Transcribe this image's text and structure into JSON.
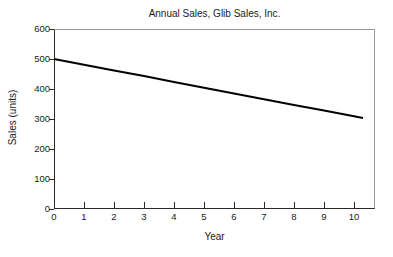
{
  "chart_data": {
    "type": "line",
    "title": "Annual Sales, Glib Sales, Inc.",
    "xlabel": "Year",
    "ylabel": "Sales (units)",
    "xlim": [
      0,
      10.7
    ],
    "ylim": [
      0,
      600
    ],
    "grid": false,
    "legend": null,
    "xticks": [
      0,
      1,
      2,
      3,
      4,
      5,
      6,
      7,
      8,
      9,
      10
    ],
    "xtick_labels": [
      "0",
      "1",
      "2",
      "3",
      "4",
      "5",
      "6",
      "7",
      "8",
      "9",
      "10"
    ],
    "yticks": [
      0,
      100,
      200,
      300,
      400,
      500,
      600
    ],
    "ytick_labels": [
      "0",
      "100",
      "200",
      "300",
      "400",
      "500",
      "600"
    ],
    "series": [
      {
        "name": "Annual Sales",
        "color": "#000000",
        "line_width": 2,
        "x": [
          0,
          10.3
        ],
        "values": [
          500,
          303
        ],
        "points": [
          {
            "x": 0,
            "y": 500
          },
          {
            "x": 1,
            "y": 481
          },
          {
            "x": 2,
            "y": 462
          },
          {
            "x": 3,
            "y": 443
          },
          {
            "x": 4,
            "y": 423
          },
          {
            "x": 5,
            "y": 404
          },
          {
            "x": 6,
            "y": 385
          },
          {
            "x": 7,
            "y": 366
          },
          {
            "x": 8,
            "y": 347
          },
          {
            "x": 9,
            "y": 328
          },
          {
            "x": 10,
            "y": 309
          },
          {
            "x": 10.3,
            "y": 303
          }
        ]
      }
    ]
  },
  "style": {
    "axis_color": "#2a2a2a",
    "frame_color": "#9a9a9a",
    "background": "#ffffff",
    "text_color": "#1a1a1a"
  }
}
